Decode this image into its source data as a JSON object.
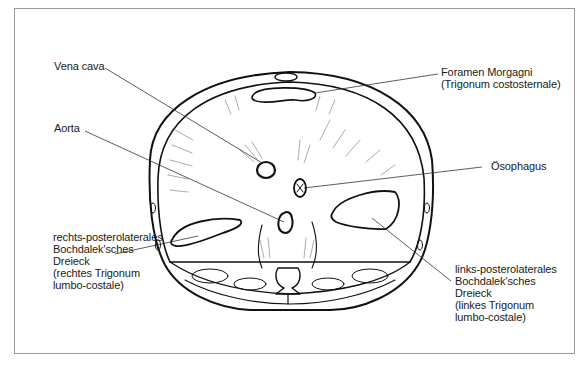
{
  "figure": {
    "labels": {
      "vena_cava": "Vena cava",
      "aorta": "Aorta",
      "foramen_morgagni_line1": "Foramen Morgagni",
      "foramen_morgagni_line2": "(Trigonum costosternale)",
      "oesophagus": "Ösophagus",
      "right_bochdalek": {
        "line1": "rechts-posterolaterales",
        "line2": "Bochdalek'sches",
        "line3": "Dreieck",
        "line4": "(rechtes Trigonum",
        "line5": "lumbo-costale)"
      },
      "left_bochdalek": {
        "line1": "links-posterolaterales",
        "line2": "Bochdalek'sches",
        "line3": "Dreieck",
        "line4": "(linkes Trigonum",
        "line5": "lumbo-costale)"
      }
    },
    "colors": {
      "ink": "#111111",
      "frame": "#9a9a9a",
      "background": "#ffffff"
    }
  }
}
